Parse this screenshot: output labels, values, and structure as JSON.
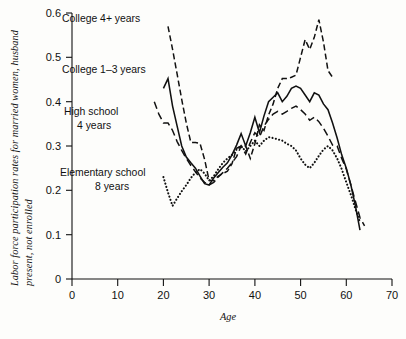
{
  "chart_data": {
    "type": "line",
    "title": "",
    "xlabel": "Age",
    "ylabel": "Labor force participation rates for married women, husband present, not enrolled",
    "ylabel_line1": "Labor force participation rates for married women, husband",
    "ylabel_line2": "present, not enrolled",
    "xlim": [
      0,
      70
    ],
    "ylim": [
      0,
      0.6
    ],
    "xticks": [
      0,
      10,
      20,
      30,
      40,
      50,
      60,
      70
    ],
    "xticklabels": [
      "0",
      "10",
      "20",
      "30",
      "40",
      "50",
      "60",
      "70"
    ],
    "yticks": [
      0,
      0.1,
      0.2,
      0.3,
      0.4,
      0.5,
      0.6
    ],
    "yticklabels": [
      "0",
      "0.1",
      "0.2",
      "0.3",
      "0.4",
      "0.5",
      "0.6"
    ],
    "grid": false,
    "legend_position": "inline-annotations",
    "series": [
      {
        "name": "College 4+ years",
        "style": "dashed",
        "label": "College 4+ years",
        "label_x": 62,
        "label_y": 22,
        "x": [
          21,
          22,
          23,
          24,
          25,
          26,
          27,
          28,
          29,
          30,
          31,
          32,
          33,
          34,
          35,
          36,
          37,
          38,
          39,
          40,
          41,
          42,
          43,
          44,
          45,
          46,
          47,
          48,
          49,
          50,
          51,
          52,
          53,
          54,
          55,
          56,
          57
        ],
        "y": [
          0.57,
          0.518,
          0.462,
          0.405,
          0.352,
          0.308,
          0.308,
          0.306,
          0.27,
          0.222,
          0.222,
          0.232,
          0.238,
          0.243,
          0.26,
          0.295,
          0.3,
          0.3,
          0.272,
          0.305,
          0.348,
          0.335,
          0.37,
          0.395,
          0.43,
          0.452,
          0.452,
          0.455,
          0.46,
          0.5,
          0.54,
          0.518,
          0.545,
          0.585,
          0.535,
          0.47,
          0.455
        ]
      },
      {
        "name": "College 1-3 years",
        "style": "solid",
        "label": "College 1–3 years",
        "label_x": 62,
        "label_y": 73,
        "x": [
          20,
          21,
          22,
          23,
          24,
          25,
          26,
          27,
          28,
          29,
          30,
          31,
          32,
          33,
          34,
          35,
          36,
          37,
          38,
          39,
          40,
          41,
          42,
          43,
          44,
          45,
          46,
          47,
          48,
          49,
          50,
          51,
          52,
          53,
          54,
          55,
          56,
          57,
          58,
          59,
          60,
          61,
          62,
          63
        ],
        "y": [
          0.43,
          0.452,
          0.39,
          0.345,
          0.3,
          0.275,
          0.262,
          0.25,
          0.232,
          0.215,
          0.212,
          0.228,
          0.24,
          0.252,
          0.262,
          0.28,
          0.302,
          0.328,
          0.3,
          0.33,
          0.365,
          0.33,
          0.368,
          0.4,
          0.41,
          0.42,
          0.4,
          0.412,
          0.43,
          0.435,
          0.43,
          0.415,
          0.4,
          0.42,
          0.415,
          0.395,
          0.382,
          0.352,
          0.318,
          0.28,
          0.25,
          0.212,
          0.165,
          0.11
        ]
      },
      {
        "name": "High school 4 years",
        "style": "dashdot",
        "label": "High school\n4 years",
        "label_line1": "High school",
        "label_line2": "4 years",
        "label_x": 64,
        "label_y": 115,
        "x": [
          18,
          19,
          20,
          21,
          22,
          23,
          24,
          25,
          26,
          27,
          28,
          29,
          30,
          31,
          32,
          33,
          34,
          35,
          36,
          37,
          38,
          39,
          40,
          41,
          42,
          43,
          44,
          45,
          46,
          47,
          48,
          49,
          50,
          51,
          52,
          53,
          54,
          55,
          56,
          57,
          58,
          59,
          60,
          61,
          62,
          63,
          64
        ],
        "y": [
          0.4,
          0.372,
          0.352,
          0.352,
          0.335,
          0.31,
          0.29,
          0.272,
          0.256,
          0.242,
          0.228,
          0.218,
          0.212,
          0.218,
          0.23,
          0.24,
          0.25,
          0.262,
          0.276,
          0.3,
          0.282,
          0.308,
          0.33,
          0.32,
          0.345,
          0.36,
          0.372,
          0.378,
          0.372,
          0.378,
          0.385,
          0.39,
          0.382,
          0.372,
          0.358,
          0.365,
          0.355,
          0.34,
          0.322,
          0.302,
          0.3,
          0.272,
          0.248,
          0.212,
          0.175,
          0.138,
          0.12
        ]
      },
      {
        "name": "Elementary school 8 years",
        "style": "dotted",
        "label": "Elementary school\n8 years",
        "label_line1": "Elementary school",
        "label_line2": "8 years",
        "label_x": 60,
        "label_y": 176,
        "x": [
          20,
          21,
          22,
          23,
          24,
          25,
          26,
          27,
          28,
          29,
          30,
          31,
          32,
          33,
          34,
          35,
          36,
          37,
          38,
          39,
          40,
          41,
          42,
          43,
          44,
          45,
          46,
          47,
          48,
          49,
          50,
          51,
          52,
          53,
          54,
          55,
          56,
          57,
          58,
          59,
          60,
          61,
          62,
          63
        ],
        "y": [
          0.23,
          0.195,
          0.165,
          0.182,
          0.198,
          0.212,
          0.228,
          0.24,
          0.248,
          0.238,
          0.222,
          0.232,
          0.248,
          0.262,
          0.272,
          0.28,
          0.292,
          0.3,
          0.288,
          0.3,
          0.312,
          0.3,
          0.312,
          0.32,
          0.318,
          0.315,
          0.312,
          0.305,
          0.3,
          0.29,
          0.272,
          0.258,
          0.25,
          0.262,
          0.278,
          0.292,
          0.3,
          0.29,
          0.272,
          0.248,
          0.218,
          0.19,
          0.158,
          0.128
        ]
      }
    ]
  }
}
